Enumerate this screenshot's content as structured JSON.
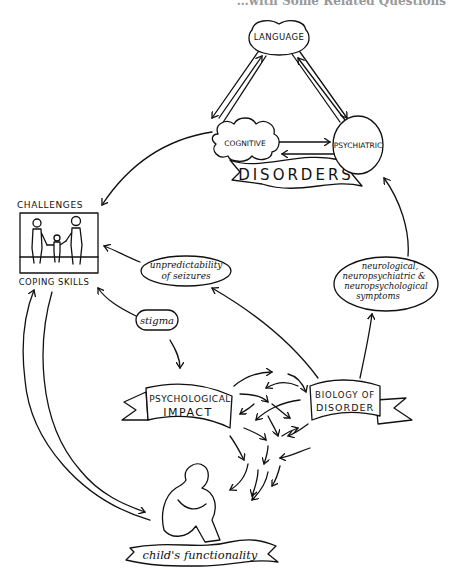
{
  "header": {
    "partial_title": "…with Some Related Questions"
  },
  "disorders": {
    "banner": "DISORDERS",
    "nodes": {
      "language": "LANGUAGE",
      "cognitive": "COGNITIVE",
      "psychiatric": "PSYCHIATRIC"
    }
  },
  "challenges": {
    "top_label": "CHALLENGES",
    "bottom_label": "COPING SKILLS",
    "illustration": "family-holding-hands"
  },
  "unpredictability": {
    "line1": "unpredictability",
    "line2": "of seizures"
  },
  "stigma": {
    "label": "stigma"
  },
  "symptoms": {
    "line1": "neurological,",
    "line2": "neuropsychiatric &",
    "line3": "neuropsychological",
    "line4": "symptoms"
  },
  "psych_impact": {
    "line1": "PSYCHOLOGICAL",
    "line2": "IMPACT"
  },
  "biology": {
    "line1": "BIOLOGY OF",
    "line2": "DISORDER"
  },
  "functionality": {
    "label": "child's functionality",
    "illustration": "child-hugging-knees"
  },
  "colors": {
    "ink": "#111111",
    "background": "#ffffff"
  }
}
